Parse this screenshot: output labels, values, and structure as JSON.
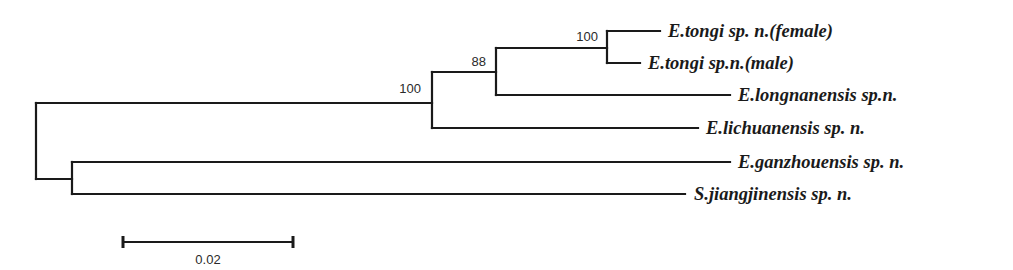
{
  "figure": {
    "type": "phylogenetic-tree",
    "layout": "rectangular",
    "line_color": "#1a1a1a"
  },
  "taxa": [
    {
      "id": "tongi_female",
      "label": "E.tongi sp. n.(female)"
    },
    {
      "id": "tongi_male",
      "label": "E.tongi sp.n.(male)"
    },
    {
      "id": "longnanensis",
      "label": "E.longnanensis sp.n."
    },
    {
      "id": "lichuanensis",
      "label": "E.lichuanensis sp. n."
    },
    {
      "id": "ganzhouensis",
      "label": "E.ganzhouensis sp. n."
    },
    {
      "id": "jiangjinensis",
      "label": "S.jiangjinensis sp. n."
    }
  ],
  "support_values": {
    "tongi_clade": "100",
    "tongi_longnanensis_clade": "88",
    "ingroup_clade": "100"
  },
  "scale_bar": {
    "label": "0.02",
    "value": 0.02
  },
  "newick": "(((((E.tongi_female:0.0062,E.tongi_male:0.0039)100:0.0131,E.longnanensis:0.0275)88:0.0075,E.lichuanensis:0.0313)100:0.0466,(E.ganzhouensis:0.0774,S.jiangjinensis:0.0721):0.0042);",
  "branch_lengths": {
    "root_to_ingroup": 0.0466,
    "ingroup_to_88": 0.0075,
    "88_to_tongi": 0.0131,
    "tongi_to_female": 0.0062,
    "tongi_to_male": 0.0039,
    "88_to_longnanensis": 0.0275,
    "ingroup_to_lichuanensis": 0.0313,
    "root_to_outgroup": 0.0042,
    "outgroup_to_ganzhouensis": 0.0774,
    "outgroup_to_jiangjinensis": 0.0721
  }
}
